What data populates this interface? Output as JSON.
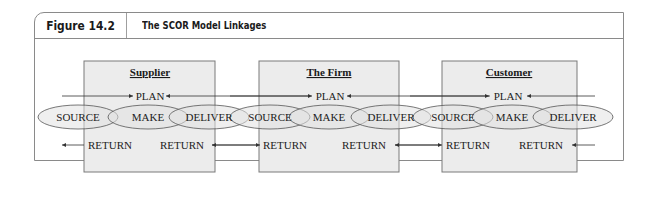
{
  "figure": {
    "label": "Figure 14.2",
    "title": "The SCOR Model Linkages"
  },
  "entities": [
    {
      "name": "Supplier"
    },
    {
      "name": "The Firm"
    },
    {
      "name": "Customer"
    }
  ],
  "process_labels": {
    "plan": "PLAN",
    "source": "SOURCE",
    "make": "MAKE",
    "deliver": "DELIVER",
    "return": "RETURN"
  },
  "colors": {
    "frame": "#8a8a8a",
    "box_fill": "#ececec",
    "box_stroke": "#7a7a7a",
    "ellipse_fill": "#e2e2e2",
    "ellipse_stroke": "#555555",
    "text": "#1a1a1a"
  }
}
